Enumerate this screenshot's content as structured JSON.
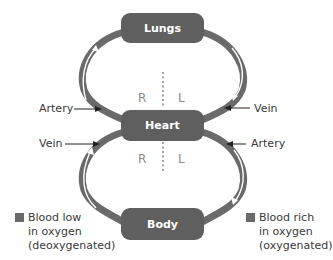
{
  "diagram": {
    "title": "",
    "nodes": {
      "lungs": "Lungs",
      "heart": "Heart",
      "body": "Body"
    },
    "sides": {
      "upper_right": "R",
      "upper_left": "L",
      "lower_right": "R",
      "lower_left": "L"
    },
    "labels": {
      "upper_left_vessel": "Artery",
      "upper_right_vessel": "Vein",
      "lower_left_vessel": "Vein",
      "lower_right_vessel": "Artery"
    },
    "legend": [
      {
        "lines": [
          "Blood low",
          "in oxygen",
          "(deoxygenated)"
        ],
        "color": "#6a6a6a"
      },
      {
        "lines": [
          "Blood rich",
          "in oxygen",
          "(oxygenated)"
        ],
        "color": "#6a6a6a"
      }
    ],
    "colors": {
      "box": "#5f5f5f",
      "vessel": "#6a6a6a",
      "flow_arrow": "#ffffff",
      "divider": "#666666"
    }
  }
}
